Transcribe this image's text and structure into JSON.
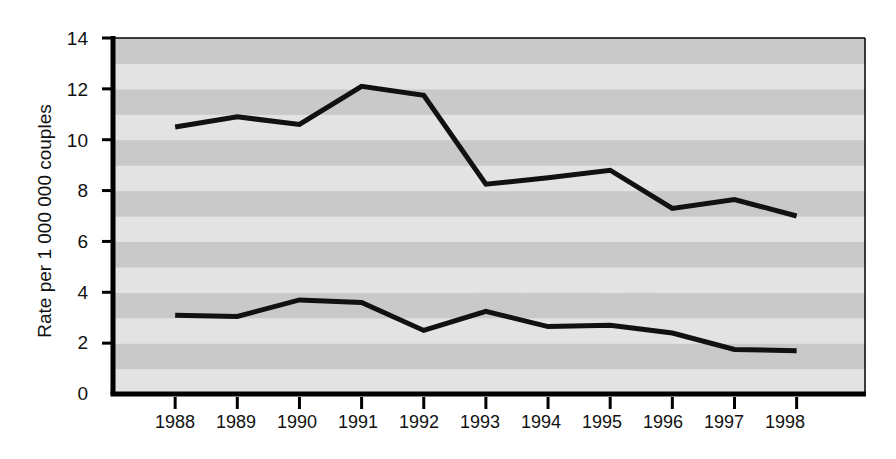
{
  "chart_data": {
    "type": "line",
    "title": "",
    "subtitle": "",
    "xlabel": "",
    "ylabel": "Rate per 1 000 000 couples",
    "x": [
      1988,
      1989,
      1990,
      1991,
      1992,
      1993,
      1994,
      1995,
      1996,
      1997,
      1998
    ],
    "xtick_labels": [
      "1988",
      "1989",
      "1990",
      "1991",
      "1992",
      "1993",
      "1994",
      "1995",
      "1996",
      "1997",
      "1998"
    ],
    "ytick_labels": [
      "0",
      "2",
      "4",
      "6",
      "8",
      "10",
      "12",
      "14"
    ],
    "yticks": [
      0,
      2,
      4,
      6,
      8,
      10,
      12,
      14
    ],
    "ylim": [
      0,
      14
    ],
    "xlim": [
      1987.0,
      1999.1
    ],
    "grid": false,
    "background_bands": true,
    "legend_position": "inline-annotation",
    "series": [
      {
        "name": "Female victims",
        "n": 763,
        "annotation": "Female victims N = 763",
        "annotation_prefix": "Female victims ",
        "annotation_symbol": "N",
        "annotation_suffix": " = 763",
        "color": "#111111",
        "values": [
          10.5,
          10.9,
          10.6,
          12.1,
          11.75,
          8.25,
          8.5,
          8.8,
          7.3,
          7.65,
          7.0
        ]
      },
      {
        "name": "Male victims",
        "n": 222,
        "annotation": "Male victims N = 222",
        "annotation_prefix": "Male victims ",
        "annotation_symbol": "N",
        "annotation_suffix": " = 222",
        "color": "#111111",
        "values": [
          3.1,
          3.05,
          3.7,
          3.6,
          2.5,
          3.25,
          2.65,
          2.7,
          2.4,
          1.75,
          1.7
        ]
      }
    ]
  },
  "axes": {
    "y_title": "Rate per 1 000 000 couples",
    "y_ticks": [
      {
        "label": "14",
        "value": 14
      },
      {
        "label": "12",
        "value": 12
      },
      {
        "label": "10",
        "value": 10
      },
      {
        "label": "8",
        "value": 8
      },
      {
        "label": "6",
        "value": 6
      },
      {
        "label": "4",
        "value": 4
      },
      {
        "label": "2",
        "value": 2
      },
      {
        "label": "0",
        "value": 0
      }
    ],
    "x_ticks": [
      {
        "label": "1988",
        "value": 1988
      },
      {
        "label": "1989",
        "value": 1989
      },
      {
        "label": "1990",
        "value": 1990
      },
      {
        "label": "1991",
        "value": 1991
      },
      {
        "label": "1992",
        "value": 1992
      },
      {
        "label": "1993",
        "value": 1993
      },
      {
        "label": "1994",
        "value": 1994
      },
      {
        "label": "1995",
        "value": 1995
      },
      {
        "label": "1996",
        "value": 1996
      },
      {
        "label": "1997",
        "value": 1997
      },
      {
        "label": "1998",
        "value": 1998
      }
    ]
  },
  "colors": {
    "line": "#111111",
    "axis": "#000000",
    "band_light": "#e3e3e3",
    "band_dark": "#c9c9c9",
    "text": "#111111",
    "page_background": "#ffffff"
  }
}
